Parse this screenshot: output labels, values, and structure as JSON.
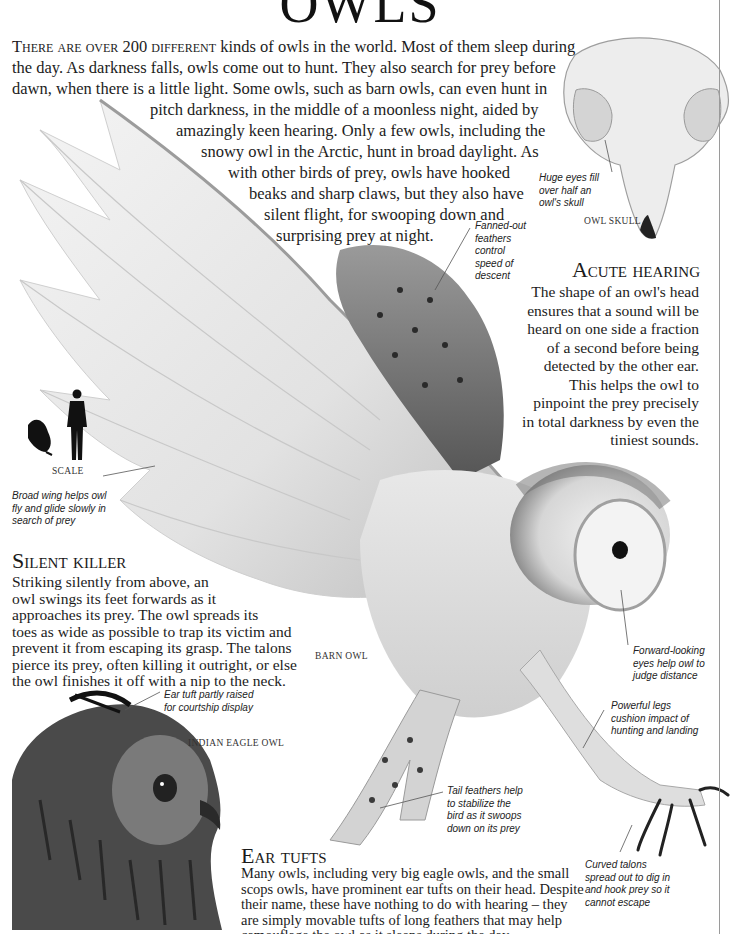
{
  "page": {
    "title": "OWLS"
  },
  "intro": {
    "lead_smallcaps": "There are over 200 different",
    "lines": [
      " kinds of owls in the world. Most of them sleep during",
      "the day. As darkness falls, owls come out to hunt. They also search for prey before",
      "dawn, when there is a little light. Some owls, such as barn owls, can even hunt in",
      "pitch darkness, in the middle of a moonless night, aided by",
      "amazingly keen hearing. Only a few owls, including the",
      "snowy owl in the Arctic, hunt in broad daylight. As",
      "with other birds of prey, owls have hooked",
      "beaks and sharp claws, but they also have",
      "silent flight, for swooping down and",
      "surprising prey at night."
    ]
  },
  "skull": {
    "label": "OWL SKULL",
    "caption_lines": [
      "Huge eyes fill",
      "over half an",
      "owl's skull"
    ]
  },
  "acute_hearing": {
    "heading": "Acute hearing",
    "lines": [
      "The shape of an owl's head",
      "ensures that a sound will be",
      "heard on one side a fraction",
      "of a second before being",
      "detected by the other ear.",
      "This helps the owl to",
      "pinpoint the prey precisely",
      "in total darkness by even the",
      "tiniest sounds."
    ]
  },
  "scale": {
    "label": "SCALE"
  },
  "captions": {
    "fanned_feathers": [
      "Fanned-out",
      "feathers",
      "control",
      "speed of",
      "descent"
    ],
    "broad_wing": [
      "Broad wing helps owl",
      "fly and glide slowly in",
      "search of prey"
    ],
    "forward_eyes": [
      "Forward-looking",
      "eyes help owl to",
      "judge distance"
    ],
    "powerful_legs": [
      "Powerful legs",
      "cushion impact of",
      "hunting and landing"
    ],
    "ear_tuft": [
      "Ear tuft partly raised",
      "for courtship display"
    ],
    "tail_feathers": [
      "Tail feathers help",
      "to stabilize the",
      "bird as it swoops",
      "down on its prey"
    ],
    "curved_talons": [
      "Curved talons",
      "spread out to dig in",
      "and hook prey so it",
      "cannot escape"
    ]
  },
  "silent_killer": {
    "heading": "Silent killer",
    "lines": [
      "Striking silently from above, an",
      "owl swings its feet forwards as it",
      "approaches its prey. The owl spreads its",
      "toes as wide as possible to trap its victim and",
      "prevent it from escaping its grasp. The talons",
      "pierce its prey, often killing it outright, or else",
      "the owl finishes it off with a nip to the neck."
    ]
  },
  "labels": {
    "barn_owl": "BARN OWL",
    "indian_eagle_owl": "INDIAN EAGLE OWL"
  },
  "ear_tufts": {
    "heading": "Ear tufts",
    "lines": [
      "Many owls, including very big eagle owls, and the small",
      "scops owls, have prominent ear tufts on their head. Despite",
      "their name, these have nothing to do with hearing – they",
      "are simply movable tufts of long feathers that may help",
      "camouflage the owl as it sleeps during the day."
    ]
  },
  "colors": {
    "text": "#1c1c1c",
    "border": "#9a9a9a",
    "background": "#ffffff"
  }
}
